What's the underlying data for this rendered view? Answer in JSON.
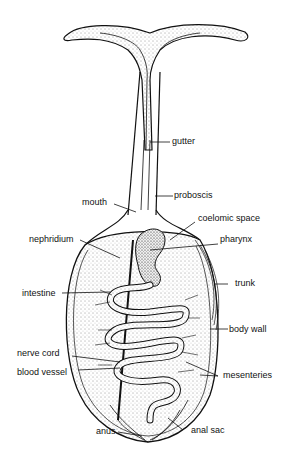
{
  "diagram": {
    "labels": {
      "gutter": "gutter",
      "proboscis": "proboscis",
      "mouth": "mouth",
      "coelomic_space": "coelomic space",
      "nephridium": "nephridium",
      "pharynx": "pharynx",
      "trunk": "trunk",
      "intestine": "intestine",
      "body_wall": "body wall",
      "nerve_cord": "nerve cord",
      "blood_vessel": "blood vessel",
      "mesenteries": "mesenteries",
      "anus": "anus",
      "anal_sac": "anal sac"
    }
  }
}
